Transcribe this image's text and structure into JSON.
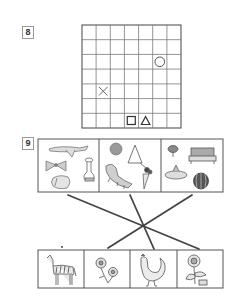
{
  "exercise8": {
    "number": "8",
    "grid": {
      "rows": 7,
      "cols": 7
    },
    "symbols": [
      {
        "shape": "circle",
        "row": 2,
        "col": 5
      },
      {
        "shape": "cross",
        "row": 4,
        "col": 1
      },
      {
        "shape": "square",
        "row": 6,
        "col": 3
      },
      {
        "shape": "triangle",
        "row": 6,
        "col": 4
      }
    ]
  },
  "exercise9": {
    "number": "9",
    "top_groups": [
      {
        "items": [
          "airplane-icon",
          "bow-icon",
          "sink-faucet-icon",
          "pillow-icon"
        ]
      },
      {
        "items": [
          "ball-icon",
          "triangle-instrument-icon",
          "crocodile-icon",
          "carrot-icon"
        ]
      },
      {
        "items": [
          "lamp-icon",
          "cake-icon",
          "bowl-icon",
          "watermelon-icon"
        ]
      }
    ],
    "bottom_items": [
      "zebra-icon",
      "flowers-icon",
      "rooster-icon",
      "sunflower-icon"
    ],
    "connections": [
      {
        "from_group": 0,
        "to_item": 3
      },
      {
        "from_group": 1,
        "to_item": 2
      },
      {
        "from_group": 2,
        "to_item": 1
      }
    ]
  }
}
